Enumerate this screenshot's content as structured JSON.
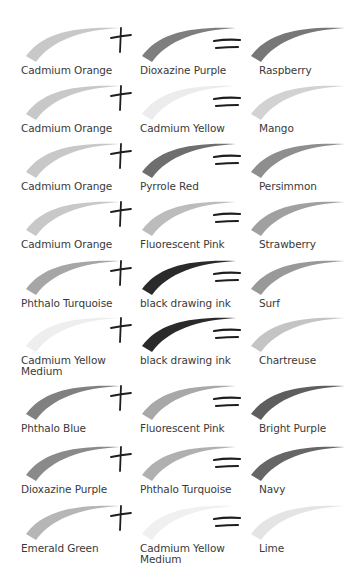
{
  "rows": [
    {
      "a": {
        "name": "Cadmium Orange",
        "shade": "#c8c8c8"
      },
      "b": {
        "name": "Dioxazine Purple",
        "shade": "#7e7e7e"
      },
      "result": {
        "name": "Raspberry",
        "shade": "#777777"
      }
    },
    {
      "a": {
        "name": "Cadmium Orange",
        "shade": "#c8c8c8"
      },
      "b": {
        "name": "Cadmium Yellow",
        "shade": "#ececec"
      },
      "result": {
        "name": "Mango",
        "shade": "#d2d2d2"
      }
    },
    {
      "a": {
        "name": "Cadmium Orange",
        "shade": "#c8c8c8"
      },
      "b": {
        "name": "Pyrrole Red",
        "shade": "#6e6e6e"
      },
      "result": {
        "name": "Persimmon",
        "shade": "#8e8e8e"
      }
    },
    {
      "a": {
        "name": "Cadmium Orange",
        "shade": "#c8c8c8"
      },
      "b": {
        "name": "Fluorescent Pink",
        "shade": "#bcbcbc"
      },
      "result": {
        "name": "Strawberry",
        "shade": "#a0a0a0"
      }
    },
    {
      "a": {
        "name": "Phthalo Turquoise",
        "shade": "#a6a6a6"
      },
      "b": {
        "name": "black drawing ink",
        "shade": "#2a2a2a"
      },
      "result": {
        "name": "Surf",
        "shade": "#999999"
      }
    },
    {
      "a": {
        "name": "Cadmium Yellow\nMedium",
        "shade": "#eeeeee"
      },
      "b": {
        "name": "black drawing ink",
        "shade": "#2a2a2a"
      },
      "result": {
        "name": "Chartreuse",
        "shade": "#c4c4c4"
      }
    },
    {
      "a": {
        "name": "Phthalo Blue",
        "shade": "#808080"
      },
      "b": {
        "name": "Fluorescent Pink",
        "shade": "#a8a8a8"
      },
      "result": {
        "name": "Bright Purple",
        "shade": "#5e5e5e"
      }
    },
    {
      "a": {
        "name": "Dioxazine Purple",
        "shade": "#8a8a8a"
      },
      "b": {
        "name": "Phthalo Turquoise",
        "shade": "#b0b0b0"
      },
      "result": {
        "name": "Navy",
        "shade": "#666666"
      }
    },
    {
      "a": {
        "name": "Emerald Green",
        "shade": "#b6b6b6"
      },
      "b": {
        "name": "Cadmium Yellow\nMedium",
        "shade": "#f0f0f0"
      },
      "result": {
        "name": "Lime",
        "shade": "#e4e4e4"
      }
    }
  ],
  "operators": {
    "plus": "+",
    "equals": "="
  },
  "layout": {
    "row_tops": [
      22,
      80,
      138,
      196,
      255,
      312,
      380,
      441,
      500
    ]
  }
}
